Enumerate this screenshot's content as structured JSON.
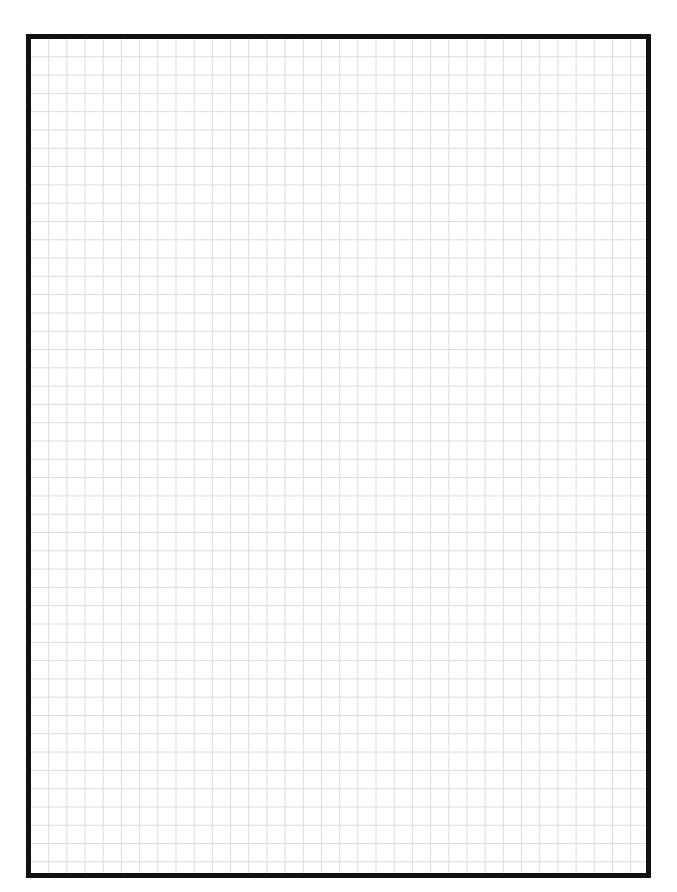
{
  "page": {
    "type": "graph-paper-sheet",
    "header_text_clipped": "",
    "grid": {
      "columns": 34,
      "rows": 46,
      "line_color": "#dcdcdc",
      "border_color": "#111111",
      "background": "#ffffff"
    }
  }
}
